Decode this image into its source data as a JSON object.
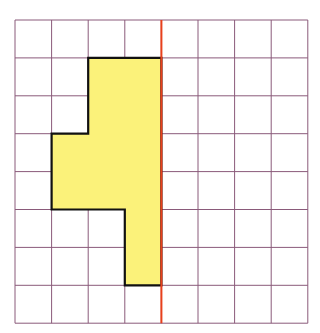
{
  "diagram": {
    "type": "symmetry-grid",
    "grid": {
      "columns": 8,
      "rows": 8,
      "origin_x": 15,
      "origin_y": 20,
      "cell_width": 36.6,
      "cell_height": 37.9,
      "line_color": "#8a5a7a"
    },
    "mirror_line": {
      "orientation": "vertical",
      "column_index": 4,
      "color": "#e8401c"
    },
    "shape": {
      "fill": "#fbf27a",
      "stroke": "#111111",
      "polygon_cells": [
        [
          2,
          1
        ],
        [
          4,
          1
        ],
        [
          4,
          7
        ],
        [
          3,
          7
        ],
        [
          3,
          5
        ],
        [
          1,
          5
        ],
        [
          1,
          3
        ],
        [
          2,
          3
        ]
      ],
      "filled_cells": [
        [
          2,
          1
        ],
        [
          3,
          1
        ],
        [
          2,
          2
        ],
        [
          3,
          2
        ],
        [
          1,
          3
        ],
        [
          2,
          3
        ],
        [
          3,
          3
        ],
        [
          1,
          4
        ],
        [
          2,
          4
        ],
        [
          3,
          4
        ],
        [
          3,
          5
        ],
        [
          3,
          6
        ]
      ]
    }
  }
}
